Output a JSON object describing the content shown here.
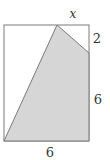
{
  "diagram": {
    "labels": {
      "top": "x",
      "right_top": "2",
      "right_bottom": "6",
      "bottom": "6"
    },
    "colors": {
      "stroke": "#7a7a7a",
      "shaded_fill": "#d6d6d6",
      "background": "#ffffff",
      "label": "#333333"
    }
  }
}
